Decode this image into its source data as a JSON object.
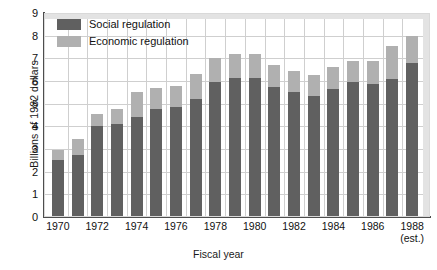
{
  "chart_data": {
    "type": "bar",
    "subtype": "stacked-vertical",
    "title": "",
    "xlabel": "Fiscal year",
    "ylabel": "Billions of 1982 dollars",
    "ylim": [
      0,
      9
    ],
    "yticks": [
      "0",
      "1",
      "2",
      "3",
      "4",
      "5",
      "6",
      "7",
      "8",
      "9"
    ],
    "grid": true,
    "legend_position": "top-left-inside",
    "categories": [
      "1970",
      "1971",
      "1972",
      "1973",
      "1974",
      "1975",
      "1976",
      "1977",
      "1978",
      "1979",
      "1980",
      "1981",
      "1982",
      "1983",
      "1984",
      "1985",
      "1986",
      "1987",
      "1988"
    ],
    "xtick_labels": [
      {
        "value": "1970",
        "note": ""
      },
      {
        "value": "1972",
        "note": ""
      },
      {
        "value": "1974",
        "note": ""
      },
      {
        "value": "1976",
        "note": ""
      },
      {
        "value": "1978",
        "note": ""
      },
      {
        "value": "1980",
        "note": ""
      },
      {
        "value": "1982",
        "note": ""
      },
      {
        "value": "1984",
        "note": ""
      },
      {
        "value": "1986",
        "note": ""
      },
      {
        "value": "1988",
        "note": "(est.)"
      }
    ],
    "series": [
      {
        "name": "Social regulation",
        "color": "#606060",
        "values": [
          2.5,
          2.75,
          4.0,
          4.1,
          4.4,
          4.75,
          4.85,
          5.2,
          5.95,
          6.15,
          6.15,
          5.75,
          5.5,
          5.35,
          5.65,
          5.95,
          5.85,
          6.1,
          6.8
        ]
      },
      {
        "name": "Economic regulation",
        "color": "#b0b0b0",
        "values": [
          0.45,
          0.7,
          0.55,
          0.65,
          1.1,
          0.95,
          0.95,
          1.1,
          1.05,
          1.05,
          1.05,
          0.95,
          0.95,
          0.9,
          0.95,
          0.95,
          1.05,
          1.45,
          1.2
        ]
      }
    ],
    "totals": [
      2.95,
      3.45,
      4.55,
      4.75,
      5.5,
      5.7,
      5.8,
      6.3,
      7.0,
      7.2,
      7.2,
      6.7,
      6.45,
      6.25,
      6.6,
      6.9,
      6.9,
      7.55,
      8.0
    ]
  },
  "legend": {
    "items": [
      {
        "label": "Social regulation",
        "swatch": "social-swatch"
      },
      {
        "label": "Economic regulation",
        "swatch": "economic-swatch"
      }
    ]
  },
  "colors": {
    "social": "#606060",
    "economic": "#b0b0b0",
    "grid": "#cfcfcf",
    "axis": "#4d4d4d",
    "band": "#e3e3e3",
    "background": "#ffffff"
  }
}
